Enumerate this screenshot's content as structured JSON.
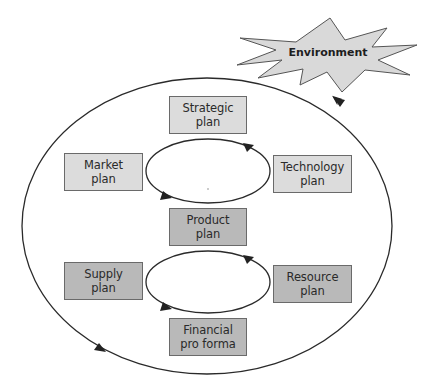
{
  "diagram": {
    "title": "",
    "environment": {
      "label": "Environment",
      "shape": "starburst",
      "fill": "#d9d9d9",
      "stroke": "#555555"
    },
    "outer_cycle": {
      "direction": "counter-clockwise",
      "stroke": "#2a2a2a"
    },
    "upper_cycle": {
      "direction": "counter-clockwise",
      "connects": [
        "Strategic plan",
        "Market plan",
        "Product plan",
        "Technology plan"
      ]
    },
    "lower_cycle": {
      "direction": "counter-clockwise",
      "connects": [
        "Product plan",
        "Supply plan",
        "Financial pro forma",
        "Resource plan"
      ]
    },
    "boxes": {
      "strategic": {
        "line1": "Strategic",
        "line2": "plan",
        "fill": "#dcdcdc"
      },
      "market": {
        "line1": "Market",
        "line2": "plan",
        "fill": "#dcdcdc"
      },
      "technology": {
        "line1": "Technology",
        "line2": "plan",
        "fill": "#dcdcdc"
      },
      "product": {
        "line1": "Product",
        "line2": "plan",
        "fill": "#b9b9b9"
      },
      "supply": {
        "line1": "Supply",
        "line2": "plan",
        "fill": "#b9b9b9"
      },
      "resource": {
        "line1": "Resource",
        "line2": "plan",
        "fill": "#b9b9b9"
      },
      "financial": {
        "line1": "Financial",
        "line2": "pro forma",
        "fill": "#b9b9b9"
      }
    }
  }
}
